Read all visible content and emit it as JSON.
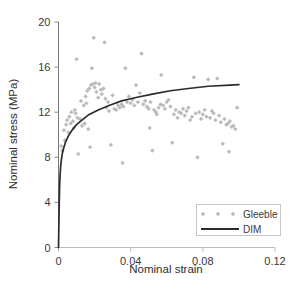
{
  "chart_data": {
    "type": "scatter",
    "title": "",
    "xlabel": "Nominal strain",
    "ylabel": "Nominal stress (MPa)",
    "xlim": [
      0,
      0.12
    ],
    "ylim": [
      0,
      20
    ],
    "xticks": [
      0,
      0.04,
      0.08,
      0.12
    ],
    "xtick_labels": [
      "0",
      "0.04",
      "0.08",
      "0.12"
    ],
    "yticks": [
      0,
      4,
      8,
      12,
      16,
      20
    ],
    "ytick_labels": [
      "0",
      "4",
      "8",
      "12",
      "16",
      "20"
    ],
    "grid": false,
    "legend_position": "lower right",
    "series": [
      {
        "name": "Gleeble",
        "type": "scatter",
        "marker": "diamond",
        "color": "#b9b9b9",
        "points": [
          [
            0.0015,
            9.0
          ],
          [
            0.0022,
            8.6
          ],
          [
            0.003,
            10.4
          ],
          [
            0.0035,
            9.5
          ],
          [
            0.0042,
            10.9
          ],
          [
            0.0048,
            11.3
          ],
          [
            0.0055,
            10.2
          ],
          [
            0.006,
            11.6
          ],
          [
            0.0068,
            11.0
          ],
          [
            0.0072,
            12.0
          ],
          [
            0.008,
            11.2
          ],
          [
            0.0085,
            10.6
          ],
          [
            0.009,
            12.2
          ],
          [
            0.0095,
            11.9
          ],
          [
            0.01,
            16.7
          ],
          [
            0.0105,
            11.5
          ],
          [
            0.011,
            8.3
          ],
          [
            0.012,
            11.4
          ],
          [
            0.0125,
            13.0
          ],
          [
            0.013,
            10.8
          ],
          [
            0.014,
            12.6
          ],
          [
            0.0145,
            11.0
          ],
          [
            0.015,
            13.4
          ],
          [
            0.0155,
            12.8
          ],
          [
            0.016,
            13.9
          ],
          [
            0.0165,
            10.5
          ],
          [
            0.017,
            14.1
          ],
          [
            0.0175,
            8.9
          ],
          [
            0.018,
            14.4
          ],
          [
            0.0185,
            15.9
          ],
          [
            0.019,
            14.5
          ],
          [
            0.0195,
            18.6
          ],
          [
            0.02,
            14.2
          ],
          [
            0.0205,
            14.6
          ],
          [
            0.021,
            13.8
          ],
          [
            0.022,
            13.3
          ],
          [
            0.0225,
            14.5
          ],
          [
            0.0235,
            14.0
          ],
          [
            0.024,
            13.6
          ],
          [
            0.025,
            14.1
          ],
          [
            0.0255,
            18.2
          ],
          [
            0.026,
            13.2
          ],
          [
            0.0265,
            12.4
          ],
          [
            0.0275,
            12.9
          ],
          [
            0.028,
            12.1
          ],
          [
            0.029,
            9.1
          ],
          [
            0.03,
            13.5
          ],
          [
            0.031,
            12.3
          ],
          [
            0.032,
            12.2
          ],
          [
            0.033,
            12.6
          ],
          [
            0.034,
            12.4
          ],
          [
            0.035,
            12.7
          ],
          [
            0.0355,
            7.5
          ],
          [
            0.036,
            12.5
          ],
          [
            0.037,
            15.9
          ],
          [
            0.038,
            12.9
          ],
          [
            0.039,
            13.4
          ],
          [
            0.04,
            12.8
          ],
          [
            0.041,
            13.1
          ],
          [
            0.042,
            12.6
          ],
          [
            0.043,
            14.4
          ],
          [
            0.044,
            12.9
          ],
          [
            0.045,
            13.7
          ],
          [
            0.046,
            17.2
          ],
          [
            0.047,
            12.7
          ],
          [
            0.048,
            13.0
          ],
          [
            0.049,
            12.5
          ],
          [
            0.05,
            12.3
          ],
          [
            0.0505,
            10.6
          ],
          [
            0.051,
            12.9
          ],
          [
            0.052,
            8.6
          ],
          [
            0.053,
            12.2
          ],
          [
            0.054,
            12.0
          ],
          [
            0.0545,
            11.8
          ],
          [
            0.0555,
            12.4
          ],
          [
            0.0565,
            12.7
          ],
          [
            0.057,
            15.3
          ],
          [
            0.058,
            12.6
          ],
          [
            0.059,
            12.3
          ],
          [
            0.06,
            12.9
          ],
          [
            0.061,
            13.1
          ],
          [
            0.062,
            12.5
          ],
          [
            0.063,
            9.3
          ],
          [
            0.064,
            11.8
          ],
          [
            0.065,
            12.2
          ],
          [
            0.066,
            11.5
          ],
          [
            0.067,
            12.0
          ],
          [
            0.068,
            11.9
          ],
          [
            0.069,
            12.3
          ],
          [
            0.07,
            11.7
          ],
          [
            0.071,
            12.1
          ],
          [
            0.072,
            12.4
          ],
          [
            0.073,
            11.3
          ],
          [
            0.074,
            11.6
          ],
          [
            0.075,
            15.1
          ],
          [
            0.076,
            11.9
          ],
          [
            0.077,
            8.0
          ],
          [
            0.078,
            12.0
          ],
          [
            0.079,
            11.4
          ],
          [
            0.08,
            11.8
          ],
          [
            0.081,
            12.2
          ],
          [
            0.082,
            11.6
          ],
          [
            0.083,
            14.9
          ],
          [
            0.084,
            11.5
          ],
          [
            0.085,
            12.1
          ],
          [
            0.086,
            11.9
          ],
          [
            0.087,
            11.3
          ],
          [
            0.088,
            15.0
          ],
          [
            0.089,
            11.7
          ],
          [
            0.09,
            11.1
          ],
          [
            0.091,
            9.2
          ],
          [
            0.092,
            11.4
          ],
          [
            0.093,
            10.9
          ],
          [
            0.094,
            11.0
          ],
          [
            0.0945,
            8.5
          ],
          [
            0.095,
            11.2
          ],
          [
            0.096,
            10.7
          ],
          [
            0.097,
            10.8
          ],
          [
            0.098,
            10.5
          ],
          [
            0.099,
            12.4
          ]
        ]
      },
      {
        "name": "DIM",
        "type": "line",
        "color": "#2b2b2b",
        "points": [
          [
            0.0,
            0.0
          ],
          [
            0.0002,
            2.0
          ],
          [
            0.0004,
            3.9
          ],
          [
            0.0006,
            5.4
          ],
          [
            0.0009,
            6.5
          ],
          [
            0.0012,
            7.2
          ],
          [
            0.0016,
            7.8
          ],
          [
            0.0022,
            8.4
          ],
          [
            0.003,
            8.9
          ],
          [
            0.004,
            9.4
          ],
          [
            0.0055,
            9.9
          ],
          [
            0.0075,
            10.4
          ],
          [
            0.01,
            10.9
          ],
          [
            0.013,
            11.3
          ],
          [
            0.017,
            11.8
          ],
          [
            0.022,
            12.2
          ],
          [
            0.028,
            12.6
          ],
          [
            0.035,
            13.0
          ],
          [
            0.043,
            13.3
          ],
          [
            0.052,
            13.6
          ],
          [
            0.062,
            13.9
          ],
          [
            0.072,
            14.1
          ],
          [
            0.083,
            14.3
          ],
          [
            0.095,
            14.4
          ],
          [
            0.1,
            14.45
          ]
        ]
      }
    ]
  },
  "legend": {
    "entries": [
      {
        "label": "Gleeble",
        "marker": "diamond"
      },
      {
        "label": "DIM",
        "marker": "line"
      }
    ]
  }
}
